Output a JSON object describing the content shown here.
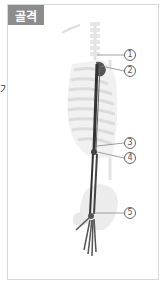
{
  "side_text": "기",
  "card": {
    "tag_label": "골격",
    "tag_color": "#8c8c8c",
    "figure": "skeleton-torso-arm",
    "callouts": [
      {
        "label": "1",
        "x": 124,
        "y": 49
      },
      {
        "label": "2",
        "x": 124,
        "y": 65
      },
      {
        "label": "3",
        "x": 124,
        "y": 137
      },
      {
        "label": "4",
        "x": 124,
        "y": 152
      },
      {
        "label": "5",
        "x": 124,
        "y": 207
      }
    ]
  }
}
